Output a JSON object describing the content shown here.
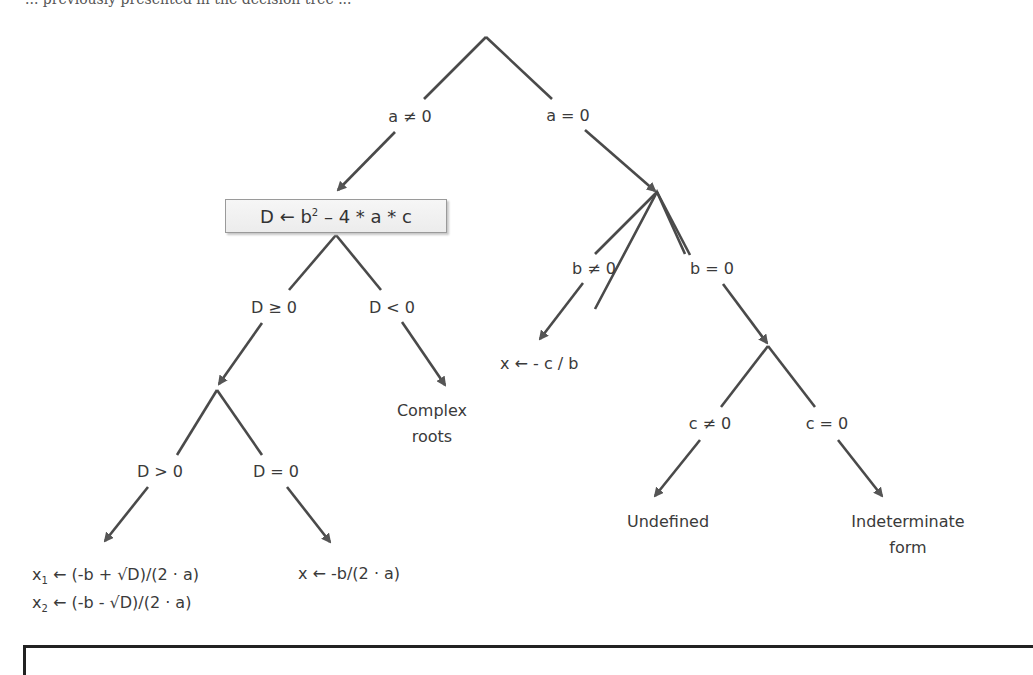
{
  "header": {
    "cutoff_text": "... previously presented in the decision tree ..."
  },
  "tree": {
    "root_branches": {
      "left": "a ≠ 0",
      "right": "a = 0"
    },
    "discriminant_box": {
      "lhs": "D ← b",
      "exp": "2",
      "rhs": " – 4 * a * c"
    },
    "discriminant_branches": {
      "left": "D ≥  0",
      "right": "D < 0"
    },
    "complex_result": {
      "line1": "Complex",
      "line2": "roots"
    },
    "nonneg_branches": {
      "left": "D > 0",
      "right": "D = 0"
    },
    "two_roots": {
      "line1_var": "x",
      "line1_sub": "1",
      "line1_expr": " ← (-b + √D)/(2 · a)",
      "line2_var": "x",
      "line2_sub": "2",
      "line2_expr": " ← (-b - √D)/(2 · a)"
    },
    "single_root": "x ← -b/(2 · a)",
    "b_branches": {
      "left": "b ≠ 0",
      "right": "b = 0"
    },
    "linear_root": "x ← - c / b",
    "c_branches": {
      "left": "c ≠ 0",
      "right": "c = 0"
    },
    "undefined_result": "Undefined",
    "indeterminate_result": {
      "line1": "Indeterminate",
      "line2": "form"
    }
  },
  "colors": {
    "line": "#4a4a4a",
    "arrowhead": "#555555",
    "text": "#3a3a3a",
    "box_border": "#9a9a9a"
  }
}
